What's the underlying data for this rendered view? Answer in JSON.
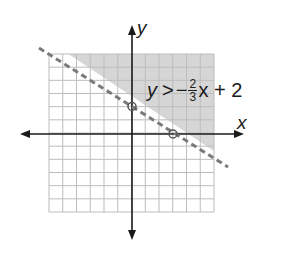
{
  "chart_data": {
    "type": "line",
    "title": "",
    "xlabel": "x",
    "ylabel": "y",
    "xlim": [
      -6,
      6
    ],
    "ylim": [
      -6,
      6
    ],
    "grid": true,
    "inequality": {
      "lhs": "y",
      "operator": ">",
      "sign": "−",
      "numerator": "2",
      "denominator": "3",
      "rest": "x + 2"
    },
    "boundary_line": {
      "slope": -0.6667,
      "intercept": 2,
      "style": "dashed"
    },
    "shaded_region": "above",
    "points": [
      {
        "x": 0,
        "y": 2,
        "label": "y-intercept"
      },
      {
        "x": 3,
        "y": 0,
        "label": "x-intercept"
      }
    ]
  },
  "labels": {
    "x_axis": "x",
    "y_axis": "y"
  },
  "colors": {
    "shade": "#d6d6d6",
    "grid": "#bdbdbd",
    "line": "#7a7a7a",
    "axis": "#1a1a1a"
  }
}
